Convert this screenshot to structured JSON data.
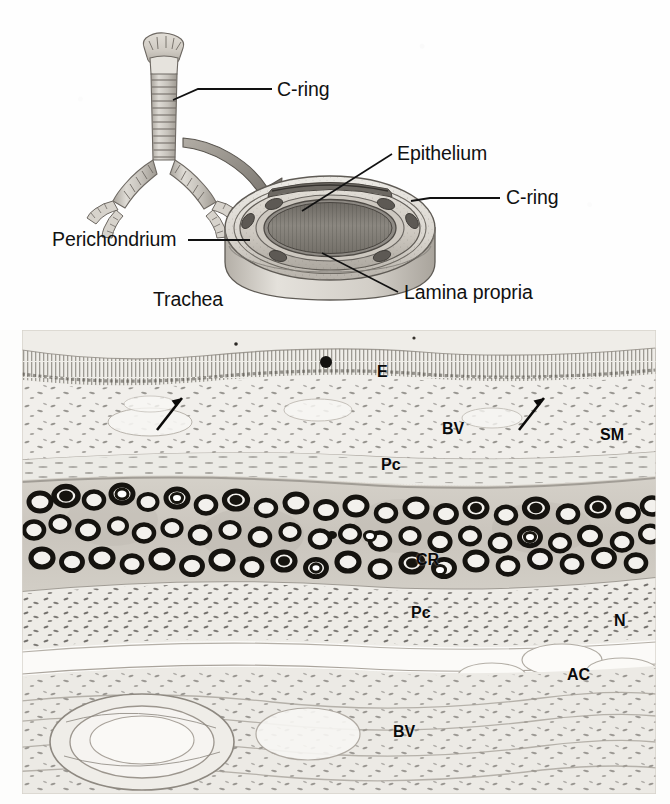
{
  "figure": {
    "type": "histology-figure",
    "panels": [
      "schematic-diagram",
      "light-micrograph"
    ]
  },
  "diagram": {
    "organ_label": "Trachea",
    "callouts": [
      {
        "id": "c-ring-whole",
        "label": "C-ring",
        "target": "tracheal cartilage ring on whole trachea"
      },
      {
        "id": "epithelium",
        "label": "Epithelium",
        "target": "luminal lining of cut trachea"
      },
      {
        "id": "c-ring-cut",
        "label": "C-ring",
        "target": "cartilage ring in cut section"
      },
      {
        "id": "perichondrium",
        "label": "Perichondrium",
        "target": "outer layer of cartilage ring"
      },
      {
        "id": "lamina-propria",
        "label": "Lamina propria",
        "target": "connective tissue beneath epithelium"
      }
    ],
    "arrow": {
      "name": "magnification-arrow",
      "from": "whole trachea",
      "to": "cut trachea section"
    }
  },
  "micrograph": {
    "description": "Light micrograph cross-section of tracheal wall",
    "labels": [
      {
        "key": "E",
        "text": "E",
        "meaning": "epithelium",
        "x": 355,
        "y": 363
      },
      {
        "key": "BV1",
        "text": "BV",
        "meaning": "blood vessel",
        "x": 420,
        "y": 420
      },
      {
        "key": "SM",
        "text": "SM",
        "meaning": "submucosa",
        "x": 578,
        "y": 426
      },
      {
        "key": "Pc1",
        "text": "Pc",
        "meaning": "perichondrium",
        "x": 359,
        "y": 456
      },
      {
        "key": "CR",
        "text": "CR",
        "meaning": "cartilage ring",
        "x": 394,
        "y": 551
      },
      {
        "key": "Pc2",
        "text": "Pc",
        "meaning": "perichondrium",
        "x": 389,
        "y": 604
      },
      {
        "key": "N",
        "text": "N",
        "meaning": "nerve",
        "x": 592,
        "y": 612
      },
      {
        "key": "AC",
        "text": "AC",
        "meaning": "adipose cells",
        "x": 545,
        "y": 666
      },
      {
        "key": "BV2",
        "text": "BV",
        "meaning": "blood vessel",
        "x": 371,
        "y": 723
      }
    ],
    "arrows": [
      {
        "name": "arrow-left",
        "x": 150,
        "y": 405,
        "angle": -28
      },
      {
        "name": "arrow-right",
        "x": 512,
        "y": 405,
        "angle": -28
      }
    ]
  },
  "colors": {
    "ink": "#111111",
    "label_ink": "#0a0a0a",
    "cartilage_fill": "#b9b4ac",
    "lumen_fill": "#8e8a84",
    "ring_outline": "#5e5a55",
    "tissue_base": "#e8e5df",
    "chondrocyte_dark": "#1d1b19",
    "page_bg": "#ffffff"
  }
}
